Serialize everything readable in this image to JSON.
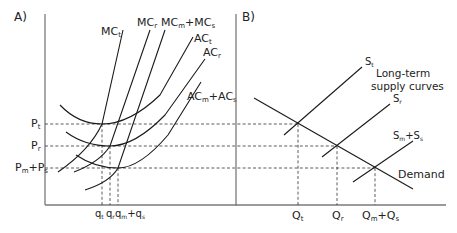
{
  "panels": {
    "a": {
      "label": "A)",
      "curve_labels": {
        "mc_t": "MC",
        "mc_t_sub": "t",
        "mc_r": "MC",
        "mc_r_sub": "r",
        "mc_ms": "MC",
        "mc_ms_sub1": "m",
        "mc_ms_plus": "+MC",
        "mc_ms_sub2": "s",
        "ac_t": "AC",
        "ac_t_sub": "t",
        "ac_r": "AC",
        "ac_r_sub": "r",
        "ac_ms": "AC",
        "ac_ms_sub1": "m",
        "ac_ms_plus": "+AC",
        "ac_ms_sub2": "s"
      },
      "y_ticks": {
        "p_t": "P",
        "p_t_sub": "t",
        "p_r": "P",
        "p_r_sub": "r",
        "p_ms": "P",
        "p_ms_sub1": "m",
        "p_ms_plus": "+P",
        "p_ms_sub2": "s"
      },
      "x_ticks": {
        "q_t": "q",
        "q_t_sub": "t",
        "q_r": "q",
        "q_r_sub": "r",
        "q_ms": "q",
        "q_ms_sub1": "m",
        "q_ms_plus": "+q",
        "q_ms_sub2": "s"
      }
    },
    "b": {
      "label": "B)",
      "curve_labels": {
        "s_t": "S",
        "s_t_sub": "t",
        "s_r": "S",
        "s_r_sub": "r",
        "s_ms": "S",
        "s_ms_sub1": "m",
        "s_ms_plus": "+S",
        "s_ms_sub2": "s",
        "demand": "Demand"
      },
      "annotation_line1": "Long-term",
      "annotation_line2": "supply curves",
      "x_ticks": {
        "q_t": "Q",
        "q_t_sub": "t",
        "q_r": "Q",
        "q_r_sub": "r",
        "q_ms": "Q",
        "q_ms_sub1": "m",
        "q_ms_plus": "+Q",
        "q_ms_sub2": "s"
      }
    }
  }
}
